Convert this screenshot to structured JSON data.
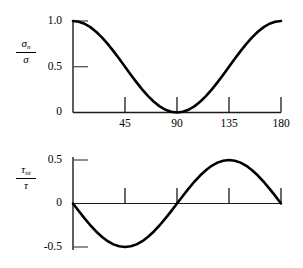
{
  "figure": {
    "background_color": "#ffffff",
    "curve_color": "#000000",
    "axis_color": "#1a1a1a"
  },
  "chart_data": [
    {
      "type": "line",
      "title": "",
      "xlabel": "",
      "ylabel": "sigma_n / sigma",
      "ylabel_numerator": "σ",
      "ylabel_numerator_sub": "n",
      "ylabel_denominator": "σ",
      "xlim": [
        0,
        180
      ],
      "ylim": [
        0,
        1.0
      ],
      "grid": false,
      "legend": "none",
      "xticks": [
        45,
        90,
        135,
        180
      ],
      "xtick_labels": [
        "45",
        "90",
        "135",
        "180"
      ],
      "yticks": [
        0,
        0.5,
        1.0
      ],
      "ytick_labels": [
        "0",
        "0.5",
        "1.0"
      ],
      "x": [
        0,
        5,
        10,
        15,
        20,
        25,
        30,
        35,
        40,
        45,
        50,
        55,
        60,
        65,
        70,
        75,
        80,
        85,
        90,
        95,
        100,
        105,
        110,
        115,
        120,
        125,
        130,
        135,
        140,
        145,
        150,
        155,
        160,
        165,
        170,
        175,
        180
      ],
      "values": [
        1.0,
        0.992,
        0.97,
        0.933,
        0.883,
        0.821,
        0.75,
        0.671,
        0.587,
        0.5,
        0.413,
        0.329,
        0.25,
        0.179,
        0.117,
        0.067,
        0.03,
        0.008,
        0.0,
        0.008,
        0.03,
        0.067,
        0.117,
        0.179,
        0.25,
        0.329,
        0.413,
        0.5,
        0.587,
        0.671,
        0.75,
        0.821,
        0.883,
        0.933,
        0.97,
        0.992,
        1.0
      ]
    },
    {
      "type": "line",
      "title": "",
      "xlabel": "",
      "ylabel": "tau_nt / tau",
      "ylabel_numerator": "τ",
      "ylabel_numerator_sub": "nt",
      "ylabel_denominator": "τ",
      "xlim": [
        0,
        180
      ],
      "ylim": [
        -0.5,
        0.5
      ],
      "grid": false,
      "legend": "none",
      "xticks": [
        45,
        90,
        135,
        180
      ],
      "xtick_labels": [
        "",
        "",
        "",
        ""
      ],
      "yticks": [
        -0.5,
        0,
        0.5
      ],
      "ytick_labels": [
        "-0.5",
        "0",
        "0.5"
      ],
      "x": [
        0,
        5,
        10,
        15,
        20,
        25,
        30,
        35,
        40,
        45,
        50,
        55,
        60,
        65,
        70,
        75,
        80,
        85,
        90,
        95,
        100,
        105,
        110,
        115,
        120,
        125,
        130,
        135,
        140,
        145,
        150,
        155,
        160,
        165,
        170,
        175,
        180
      ],
      "values": [
        0.0,
        -0.087,
        -0.171,
        -0.25,
        -0.321,
        -0.383,
        -0.433,
        -0.47,
        -0.492,
        -0.5,
        -0.492,
        -0.47,
        -0.433,
        -0.383,
        -0.321,
        -0.25,
        -0.171,
        -0.087,
        0.0,
        0.087,
        0.171,
        0.25,
        0.321,
        0.383,
        0.433,
        0.47,
        0.492,
        0.5,
        0.492,
        0.47,
        0.433,
        0.383,
        0.321,
        0.25,
        0.171,
        0.087,
        0.0
      ]
    }
  ],
  "top_plot": {
    "ytick_1_0": "1.0",
    "ytick_0_5": "0.5",
    "ytick_0": "0",
    "xtick_45": "45",
    "xtick_90": "90",
    "xtick_135": "135",
    "xtick_180": "180",
    "label_numerator": "σ",
    "label_numerator_sub": "n",
    "label_denominator": "σ"
  },
  "bottom_plot": {
    "ytick_0_5": "0.5",
    "ytick_0": "0",
    "ytick_neg_0_5": "-0.5",
    "label_numerator": "τ",
    "label_numerator_sub": "nt",
    "label_denominator": "τ"
  }
}
